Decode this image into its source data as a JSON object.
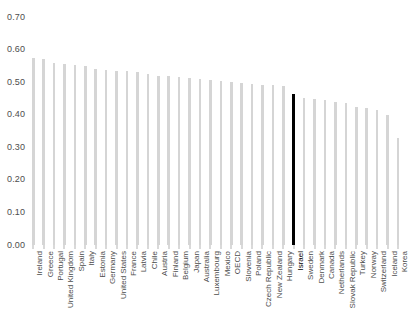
{
  "chart_data": {
    "type": "bar",
    "title": "",
    "subtitle": "",
    "xlabel": "",
    "ylabel": "",
    "ylim": [
      0.0,
      0.7
    ],
    "grid": false,
    "legend": null,
    "y_ticks": [
      "0.00",
      "0.10",
      "0.20",
      "0.30",
      "0.40",
      "0.50",
      "0.60",
      "0.70"
    ],
    "y_tick_values": [
      0.0,
      0.1,
      0.2,
      0.3,
      0.4,
      0.5,
      0.6,
      0.7
    ],
    "highlight_category": "Israel",
    "bar_color": "#d5d5d5",
    "highlight_color": "#000000",
    "categories": [
      "Ireland",
      "Greece",
      "Portugal",
      "United Kingdom",
      "Spain",
      "Italy",
      "Estonia",
      "Germany",
      "United States",
      "France",
      "Latvia",
      "Chile",
      "Austria",
      "Finland",
      "Belgium",
      "Japan",
      "Australia",
      "Luxembourg",
      "Mexico",
      "OECD",
      "Slovenia",
      "Poland",
      "Czech Republic",
      "New Zealand",
      "Hungary",
      "Israel",
      "Sweden",
      "Denmark",
      "Canada",
      "Netherlands",
      "Slovak Republic",
      "Turkey",
      "Norway",
      "Switzerland",
      "Iceland",
      "Korea"
    ],
    "values": [
      0.575,
      0.57,
      0.56,
      0.555,
      0.553,
      0.55,
      0.54,
      0.537,
      0.535,
      0.533,
      0.53,
      0.525,
      0.52,
      0.518,
      0.515,
      0.512,
      0.51,
      0.507,
      0.505,
      0.5,
      0.497,
      0.495,
      0.492,
      0.49,
      0.487,
      0.465,
      0.45,
      0.448,
      0.445,
      0.44,
      0.435,
      0.425,
      0.42,
      0.415,
      0.4,
      0.33
    ]
  }
}
